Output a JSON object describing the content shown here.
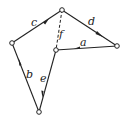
{
  "diagram": {
    "type": "directed-graph",
    "nodes": [
      {
        "id": "top",
        "x": 62,
        "y": 10
      },
      {
        "id": "left",
        "x": 12,
        "y": 43
      },
      {
        "id": "middle",
        "x": 56,
        "y": 50
      },
      {
        "id": "right",
        "x": 117,
        "y": 46
      },
      {
        "id": "bottom",
        "x": 39,
        "y": 112
      }
    ],
    "edges": [
      {
        "label": "a",
        "from": "right",
        "to": "middle",
        "style": "solid"
      },
      {
        "label": "b",
        "from": "bottom",
        "to": "left",
        "style": "solid"
      },
      {
        "label": "c",
        "from": "left",
        "to": "top",
        "style": "solid"
      },
      {
        "label": "d",
        "from": "top",
        "to": "right",
        "style": "solid"
      },
      {
        "label": "e",
        "from": "middle",
        "to": "bottom",
        "style": "solid"
      },
      {
        "label": "f",
        "from": "top",
        "to": "middle",
        "style": "dashed"
      }
    ],
    "labels": {
      "a": "a",
      "b": "b",
      "c": "c",
      "d": "d",
      "e": "e",
      "f": "f"
    },
    "colors": {
      "stroke": "#222222",
      "background": "#ffffff"
    }
  }
}
